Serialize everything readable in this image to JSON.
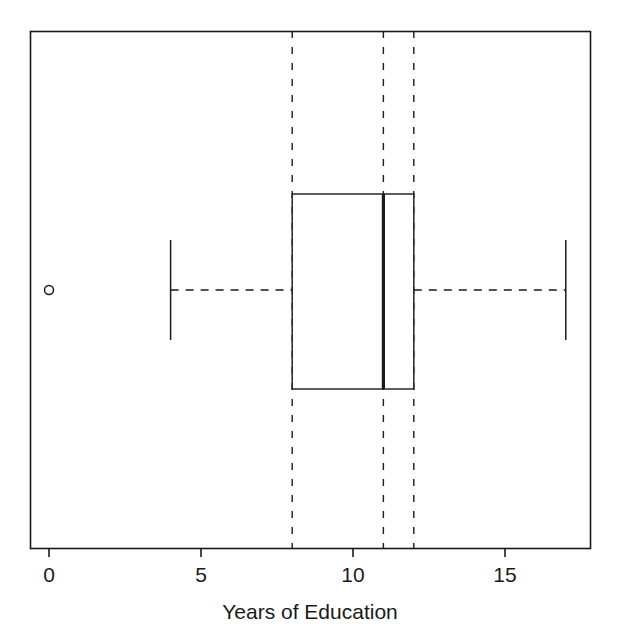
{
  "figure": {
    "width": 620,
    "height": 637,
    "background": "#ffffff",
    "stroke_color": "#1a1a1a"
  },
  "chart_data": {
    "type": "box",
    "orientation": "horizontal",
    "title": "",
    "xlabel": "Years of Education",
    "ylabel": "",
    "xlim": [
      -1.5,
      17.8
    ],
    "xticks": [
      0,
      5,
      10,
      15
    ],
    "xticklabels": [
      "0",
      "5",
      "10",
      "15"
    ],
    "grid": false,
    "reference_lines": {
      "style": "dashed",
      "values": [
        8,
        11,
        12
      ]
    },
    "legend": null,
    "boxes": [
      {
        "name": "years-of-education",
        "whisker_low": 4,
        "q1": 8,
        "median": 11,
        "q3": 12,
        "whisker_high": 17,
        "outliers": [
          0
        ]
      }
    ]
  },
  "axis": {
    "x_title": "Years of Education",
    "ticks": [
      {
        "value": 0,
        "label": "0"
      },
      {
        "value": 5,
        "label": "5"
      },
      {
        "value": 10,
        "label": "10"
      },
      {
        "value": 15,
        "label": "15"
      }
    ]
  },
  "geometry": {
    "frame": {
      "left": 30,
      "top": 31,
      "right": 590,
      "bottom": 548
    },
    "scale": {
      "origin_px": 49,
      "px_per_unit": 30.4
    },
    "box": {
      "top": 194,
      "bottom": 389
    },
    "whisker_center_y": 290,
    "whisker_cap": {
      "top": 240,
      "bottom": 340
    },
    "outlier_y": 290,
    "outlier_radius": 4.5,
    "tick_length": 9,
    "tick_label_y": 563,
    "axis_title_x": 310,
    "axis_title_y": 600
  }
}
